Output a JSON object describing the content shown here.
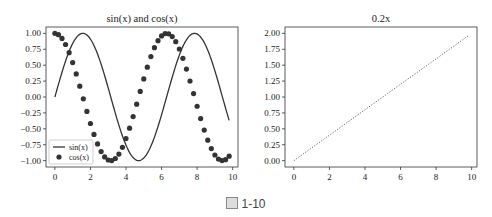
{
  "caption": {
    "figure_label": "图",
    "number": "1-10"
  },
  "chart_data": [
    {
      "type": "line",
      "title": "sin(x) and cos(x)",
      "xlabel": "",
      "ylabel": "",
      "xlim": [
        -0.5,
        10.3
      ],
      "ylim": [
        -1.1,
        1.1
      ],
      "xticks": [
        0,
        2,
        4,
        6,
        8,
        10
      ],
      "yticks": [
        1.0,
        0.75,
        0.5,
        0.25,
        0.0,
        -0.25,
        -0.5,
        -0.75,
        -1.0
      ],
      "ytick_labels": [
        "1.00",
        "0.75",
        "0.50",
        "0.25",
        "0.00",
        "−0.25",
        "−0.50",
        "−0.75",
        "−1.00"
      ],
      "legend": {
        "position": "lower left",
        "entries": [
          "sin(x)",
          "cos(x)"
        ]
      },
      "grid": false,
      "series": [
        {
          "name": "sin(x)",
          "style": "solid line",
          "color": "#333333",
          "function": "sin",
          "x_range": [
            0,
            9.8
          ],
          "num_points": 50
        },
        {
          "name": "cos(x)",
          "style": "circle markers",
          "color": "#333333",
          "function": "cos",
          "x_range": [
            0,
            9.8
          ],
          "num_points": 50
        }
      ]
    },
    {
      "type": "line",
      "title": "0.2x",
      "xlabel": "",
      "ylabel": "",
      "xlim": [
        -0.5,
        10.3
      ],
      "ylim": [
        -0.1,
        2.1
      ],
      "xticks": [
        0,
        2,
        4,
        6,
        8,
        10
      ],
      "yticks": [
        2.0,
        1.75,
        1.5,
        1.25,
        1.0,
        0.75,
        0.5,
        0.25,
        0.0
      ],
      "ytick_labels": [
        "2.00",
        "1.75",
        "1.50",
        "1.25",
        "1.00",
        "0.75",
        "0.50",
        "0.25",
        "0.00"
      ],
      "grid": false,
      "series": [
        {
          "name": "0.2x",
          "style": "dotted line",
          "color": "#666666",
          "x": [
            0,
            9.8
          ],
          "y": [
            0,
            1.96
          ]
        }
      ]
    }
  ]
}
